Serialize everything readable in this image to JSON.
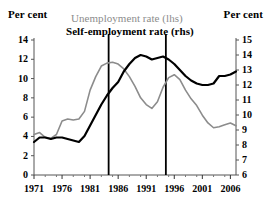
{
  "header": {
    "left_axis_title": "Per cent",
    "right_axis_title": "Per cent"
  },
  "legend": {
    "entries": [
      {
        "label": "Unemployment rate (lhs)",
        "color": "#8c8c8c",
        "bold": false
      },
      {
        "label": "Self-employment rate (rhs)",
        "color": "#000000",
        "bold": true
      }
    ]
  },
  "chart_data": {
    "type": "line",
    "title": "",
    "subtitle": "",
    "xlabel": "",
    "ylabel": "Per cent",
    "y2label": "Per cent",
    "grid": false,
    "legend_position": "top",
    "xlim": [
      1971,
      2007
    ],
    "ylim": [
      0,
      14
    ],
    "y2lim": [
      6,
      15
    ],
    "xticks": [
      1971,
      1976,
      1981,
      1986,
      1991,
      1996,
      2001,
      2006
    ],
    "xtick_labels": [
      "1971",
      "1976",
      "1981",
      "1986",
      "1991",
      "1996",
      "2001",
      "2006"
    ],
    "yticks": [
      0,
      2,
      4,
      6,
      8,
      10,
      12,
      14
    ],
    "ytick_labels": [
      "0",
      "2",
      "4",
      "6",
      "8",
      "10",
      "12",
      "14"
    ],
    "y2ticks": [
      6,
      7,
      8,
      9,
      10,
      11,
      12,
      13,
      14,
      15
    ],
    "y2tick_labels": [
      "6",
      "7",
      "8",
      "9",
      "10",
      "11",
      "12",
      "13",
      "14",
      "15"
    ],
    "minor_xticks": [
      1973,
      1975,
      1978,
      1980,
      1983,
      1985,
      1988,
      1990,
      1993,
      1995,
      1998,
      2000,
      2003,
      2005
    ],
    "annotations": [
      {
        "type": "vline",
        "x": 1984.3,
        "label": "",
        "color": "#000000"
      },
      {
        "type": "vline",
        "x": 1994.5,
        "label": "",
        "color": "#000000"
      }
    ],
    "x": [
      1971,
      1972,
      1973,
      1974,
      1975,
      1976,
      1977,
      1978,
      1979,
      1980,
      1981,
      1982,
      1983,
      1984,
      1985,
      1986,
      1987,
      1988,
      1989,
      1990,
      1991,
      1992,
      1993,
      1994,
      1995,
      1996,
      1997,
      1998,
      1999,
      2000,
      2001,
      2002,
      2003,
      2004,
      2005,
      2006,
      2007
    ],
    "series": [
      {
        "name": "Unemployment rate (lhs)",
        "axis": "left",
        "color": "#8c8c8c",
        "width": 1.6,
        "values": [
          4.2,
          4.4,
          3.9,
          3.8,
          4.2,
          5.6,
          5.8,
          5.7,
          5.8,
          6.6,
          8.8,
          10.2,
          11.3,
          11.6,
          11.7,
          11.5,
          11.0,
          10.2,
          9.2,
          8.0,
          7.3,
          6.9,
          7.6,
          9.1,
          10.1,
          10.4,
          9.9,
          8.8,
          7.9,
          7.2,
          6.2,
          5.4,
          4.9,
          5.0,
          5.2,
          5.4,
          5.1
        ]
      },
      {
        "name": "Self-employment rate (rhs)",
        "axis": "right",
        "color": "#000000",
        "width": 2.2,
        "values": [
          8.2,
          8.5,
          8.5,
          8.4,
          8.5,
          8.5,
          8.4,
          8.3,
          8.2,
          8.6,
          9.3,
          10.0,
          10.7,
          11.3,
          11.8,
          12.2,
          12.9,
          13.4,
          13.8,
          14.0,
          13.9,
          13.7,
          13.8,
          13.9,
          13.7,
          13.4,
          13.0,
          12.6,
          12.3,
          12.1,
          12.0,
          12.0,
          12.1,
          12.6,
          12.6,
          12.7,
          12.9
        ]
      }
    ]
  }
}
